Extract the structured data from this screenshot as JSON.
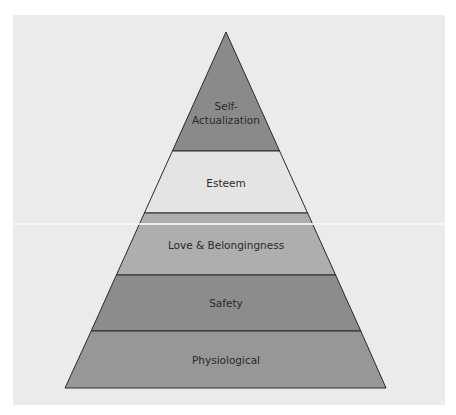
{
  "diagram": {
    "type": "pyramid",
    "title": "",
    "levels": [
      {
        "label_lines": [
          "Self-",
          "Actualization"
        ],
        "fill": "#8a8a8a"
      },
      {
        "label_lines": [
          "Esteem"
        ],
        "fill": "#e4e4e4"
      },
      {
        "label_lines": [
          "Love & Belongingness"
        ],
        "fill": "#aeaeae"
      },
      {
        "label_lines": [
          "Safety"
        ],
        "fill": "#8c8c8c"
      },
      {
        "label_lines": [
          "Physiological"
        ],
        "fill": "#979797"
      }
    ],
    "outline_color": "#2a2a2a",
    "background": "#ebebeb"
  }
}
